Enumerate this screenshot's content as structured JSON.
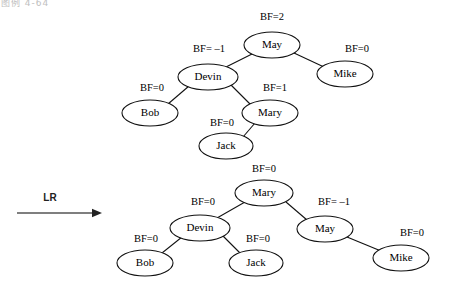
{
  "page": {
    "corner_text": "图例 4-64",
    "width": 460,
    "height": 291,
    "background": "#ffffff",
    "stroke_color": "#111111"
  },
  "operation": {
    "label": "LR",
    "arrow_name": "rotation-arrow",
    "arrow_color": "#555555",
    "x1": 17,
    "y1": 213,
    "x2": 102,
    "y2": 213,
    "label_x": 50,
    "label_y": 198
  },
  "trees": [
    {
      "name": "before-rotation-tree",
      "root": "May",
      "nodes": [
        {
          "id": "may-top",
          "label": "May",
          "bf": "BF=2",
          "cx": 272,
          "cy": 45,
          "rx": 28,
          "ry": 13,
          "bf_x": 272,
          "bf_y": 18,
          "bf_anchor": "middle"
        },
        {
          "id": "devin-top",
          "label": "Devin",
          "bf": "BF= –1",
          "cx": 208,
          "cy": 77,
          "rx": 30,
          "ry": 13,
          "bf_x": 209,
          "bf_y": 50,
          "bf_anchor": "middle"
        },
        {
          "id": "mike-top",
          "label": "Mike",
          "bf": "BF=0",
          "cx": 345,
          "cy": 74,
          "rx": 28,
          "ry": 13,
          "bf_x": 357,
          "bf_y": 50,
          "bf_anchor": "middle"
        },
        {
          "id": "bob-top",
          "label": "Bob",
          "bf": "BF=0",
          "cx": 150,
          "cy": 113,
          "rx": 28,
          "ry": 13,
          "bf_x": 152,
          "bf_y": 89,
          "bf_anchor": "middle"
        },
        {
          "id": "mary-top",
          "label": "Mary",
          "bf": "BF=1",
          "cx": 270,
          "cy": 113,
          "rx": 28,
          "ry": 13,
          "bf_x": 275,
          "bf_y": 89,
          "bf_anchor": "middle"
        },
        {
          "id": "jack-top",
          "label": "Jack",
          "bf": "BF=0",
          "cx": 226,
          "cy": 146,
          "rx": 27,
          "ry": 13,
          "bf_x": 222,
          "bf_y": 124,
          "bf_anchor": "middle"
        }
      ],
      "edges": [
        {
          "from": "may-top",
          "to": "devin-top",
          "x1": 252,
          "y1": 54,
          "x2": 224,
          "y2": 68
        },
        {
          "from": "may-top",
          "to": "mike-top",
          "x1": 294,
          "y1": 53,
          "x2": 324,
          "y2": 67
        },
        {
          "from": "devin-top",
          "to": "bob-top",
          "x1": 189,
          "y1": 86,
          "x2": 168,
          "y2": 104
        },
        {
          "from": "devin-top",
          "to": "mary-top",
          "x1": 231,
          "y1": 85,
          "x2": 251,
          "y2": 105
        },
        {
          "from": "mary-top",
          "to": "jack-top",
          "x1": 255,
          "y1": 123,
          "x2": 243,
          "y2": 137
        }
      ]
    },
    {
      "name": "after-rotation-tree",
      "root": "Mary",
      "nodes": [
        {
          "id": "mary-bot",
          "label": "Mary",
          "bf": "BF=0",
          "cx": 264,
          "cy": 193,
          "rx": 29,
          "ry": 13,
          "bf_x": 264,
          "bf_y": 170,
          "bf_anchor": "middle"
        },
        {
          "id": "devin-bot",
          "label": "Devin",
          "bf": "BF=0",
          "cx": 200,
          "cy": 228,
          "rx": 30,
          "ry": 13,
          "bf_x": 203,
          "bf_y": 203,
          "bf_anchor": "middle"
        },
        {
          "id": "may-bot",
          "label": "May",
          "bf": "BF= –1",
          "cx": 325,
          "cy": 229,
          "rx": 28,
          "ry": 13,
          "bf_x": 334,
          "bf_y": 203,
          "bf_anchor": "middle"
        },
        {
          "id": "bob-bot",
          "label": "Bob",
          "bf": "BF=0",
          "cx": 145,
          "cy": 263,
          "rx": 28,
          "ry": 13,
          "bf_x": 146,
          "bf_y": 240,
          "bf_anchor": "middle"
        },
        {
          "id": "jack-bot",
          "label": "Jack",
          "bf": "BF=0",
          "cx": 256,
          "cy": 263,
          "rx": 27,
          "ry": 13,
          "bf_x": 258,
          "bf_y": 240,
          "bf_anchor": "middle"
        },
        {
          "id": "mike-bot",
          "label": "Mike",
          "bf": "BF=0",
          "cx": 401,
          "cy": 258,
          "rx": 28,
          "ry": 13,
          "bf_x": 412,
          "bf_y": 234,
          "bf_anchor": "middle"
        }
      ],
      "edges": [
        {
          "from": "mary-bot",
          "to": "devin-bot",
          "x1": 245,
          "y1": 202,
          "x2": 217,
          "y2": 218
        },
        {
          "from": "mary-bot",
          "to": "may-bot",
          "x1": 286,
          "y1": 202,
          "x2": 307,
          "y2": 220
        },
        {
          "from": "devin-bot",
          "to": "bob-bot",
          "x1": 182,
          "y1": 237,
          "x2": 162,
          "y2": 253
        },
        {
          "from": "devin-bot",
          "to": "jack-bot",
          "x1": 223,
          "y1": 236,
          "x2": 240,
          "y2": 253
        },
        {
          "from": "may-bot",
          "to": "mike-bot",
          "x1": 347,
          "y1": 237,
          "x2": 381,
          "y2": 251
        }
      ]
    }
  ],
  "chart_data": {
    "type": "diagram",
    "before": {
      "root": "May",
      "balance_factors": {
        "May": 2,
        "Devin": -1,
        "Mike": 0,
        "Bob": 0,
        "Mary": 1,
        "Jack": 0
      },
      "structure": {
        "May": [
          "Devin",
          "Mike"
        ],
        "Devin": [
          "Bob",
          "Mary"
        ],
        "Mary": [
          "Jack",
          null
        ]
      }
    },
    "operation": "LR",
    "after": {
      "root": "Mary",
      "balance_factors": {
        "Mary": 0,
        "Devin": 0,
        "May": -1,
        "Bob": 0,
        "Jack": 0,
        "Mike": 0
      },
      "structure": {
        "Mary": [
          "Devin",
          "May"
        ],
        "Devin": [
          "Bob",
          "Jack"
        ],
        "May": [
          null,
          "Mike"
        ]
      }
    }
  }
}
